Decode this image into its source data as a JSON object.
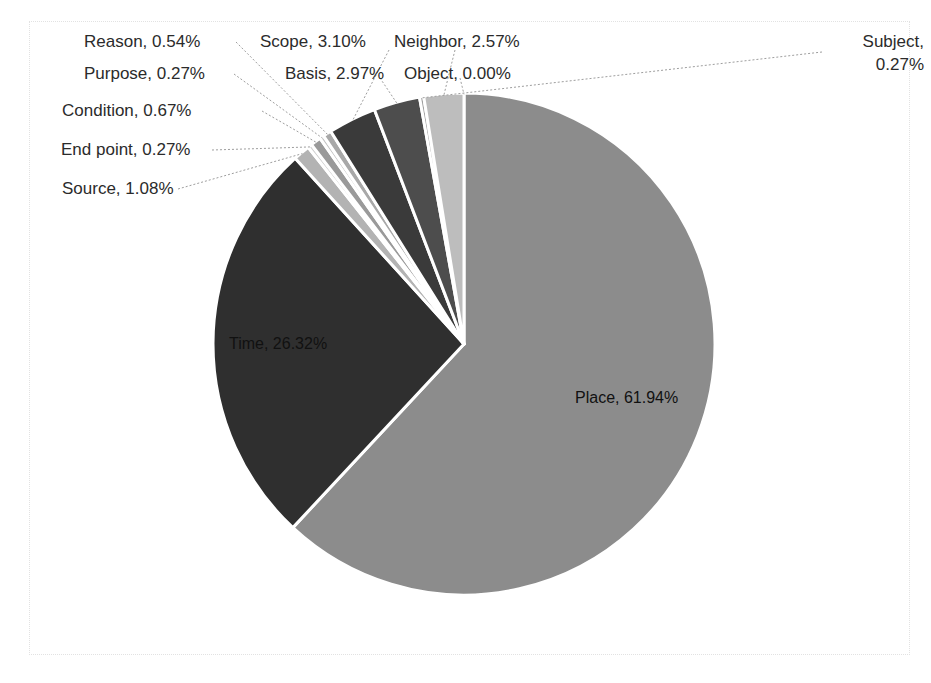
{
  "chart_data": {
    "type": "pie",
    "title": "",
    "subtitle": "",
    "xlabel": "",
    "ylabel": "",
    "legend_position": "none",
    "grid": false,
    "units": "percent",
    "labels_show_category_and_percent": true,
    "categories": [
      "Place",
      "Neighbor",
      "Object",
      "Basis",
      "Scope",
      "Reason",
      "Purpose",
      "Condition",
      "End point",
      "Source",
      "Time",
      "Subject"
    ],
    "values": [
      61.94,
      2.57,
      0.0,
      2.97,
      3.1,
      0.54,
      0.27,
      0.67,
      0.27,
      1.08,
      26.32,
      0.27
    ],
    "slices": [
      {
        "label": "Place",
        "value": 61.94,
        "display": "Place, 61.94%",
        "color": "#8c8c8c",
        "label_placement": "inside"
      },
      {
        "label": "Time",
        "value": 26.32,
        "display": "Time, 26.32%",
        "color": "#2f2f2f",
        "label_placement": "inside"
      },
      {
        "label": "Source",
        "value": 1.08,
        "display": "Source, 1.08%",
        "color": "#b3b3b3",
        "label_placement": "outside"
      },
      {
        "label": "End point",
        "value": 0.27,
        "display": "End point, 0.27%",
        "color": "#cfcfcf",
        "label_placement": "outside"
      },
      {
        "label": "Condition",
        "value": 0.67,
        "display": "Condition, 0.67%",
        "color": "#9a9a9a",
        "label_placement": "outside"
      },
      {
        "label": "Purpose",
        "value": 0.27,
        "display": "Purpose, 0.27%",
        "color": "#c4c4c4",
        "label_placement": "outside"
      },
      {
        "label": "Reason",
        "value": 0.54,
        "display": "Reason, 0.54%",
        "color": "#a8a8a8",
        "label_placement": "outside"
      },
      {
        "label": "Scope",
        "value": 3.1,
        "display": "Scope, 3.10%",
        "color": "#3a3a3a",
        "label_placement": "outside"
      },
      {
        "label": "Basis",
        "value": 2.97,
        "display": "Basis, 2.97%",
        "color": "#4d4d4d",
        "label_placement": "outside"
      },
      {
        "label": "Neighbor",
        "value": 2.57,
        "display": "Neighbor, 2.57%",
        "color": "#bdbdbd",
        "label_placement": "outside"
      },
      {
        "label": "Object",
        "value": 0.0,
        "display": "Object, 0.00%",
        "color": "#dadada",
        "label_placement": "outside"
      },
      {
        "label": "Subject",
        "value": 0.27,
        "display": "Subject, 0.27%",
        "color": "#9f9f9f",
        "label_placement": "outside"
      }
    ]
  },
  "labels": {
    "reason": "Reason, 0.54%",
    "purpose": "Purpose, 0.27%",
    "condition": "Condition, 0.67%",
    "end_point": "End point, 0.27%",
    "source": "Source, 1.08%",
    "scope": "Scope, 3.10%",
    "basis": "Basis, 2.97%",
    "neighbor": "Neighbor, 2.57%",
    "object": "Object, 0.00%",
    "subject": "Subject, 0.27%",
    "time": "Time, 26.32%",
    "place": "Place, 61.94%"
  },
  "colors": {
    "place": "#8c8c8c",
    "time": "#2f2f2f",
    "neighbor": "#bdbdbd",
    "object": "#dadada",
    "basis": "#4d4d4d",
    "scope": "#3a3a3a",
    "subject": "#9f9f9f",
    "source": "#b3b3b3",
    "end_point": "#cfcfcf",
    "condition": "#9a9a9a",
    "purpose": "#c4c4c4",
    "reason": "#a8a8a8",
    "frame_border": "#e2e2e2",
    "leader_line": "#9e9e9e",
    "slice_separator": "#ffffff",
    "label_text": "#2b2b2b",
    "background": "#ffffff"
  }
}
